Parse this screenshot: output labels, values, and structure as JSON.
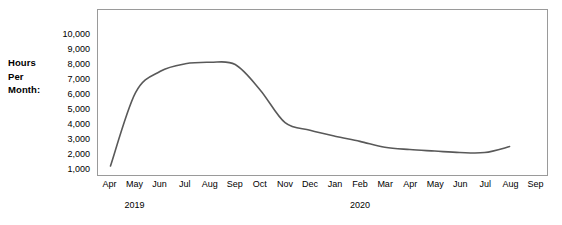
{
  "chart_data": {
    "type": "line",
    "title": "",
    "xlabel": "",
    "ylabel": "Hours Per Month:",
    "ylim": [
      0,
      10500
    ],
    "grid": false,
    "legend": "none",
    "line_color": "#595959",
    "border_color": "#9a9a9a",
    "y_ticks": [
      "10,000",
      "9,000",
      "8,000",
      "7,000",
      "6,000",
      "5,000",
      "4,000",
      "3,000",
      "2,000",
      "1,000"
    ],
    "y_tick_values": [
      10000,
      9000,
      8000,
      7000,
      6000,
      5000,
      4000,
      3000,
      2000,
      1000
    ],
    "categories": [
      "Apr",
      "May",
      "Jun",
      "Jul",
      "Aug",
      "Sep",
      "Oct",
      "Nov",
      "Dec",
      "Jan",
      "Feb",
      "Mar",
      "Apr",
      "May",
      "Jun",
      "Jul",
      "Aug",
      "Sep"
    ],
    "x_groups": [
      {
        "label": "2019",
        "start_index": 0,
        "end_index": 8,
        "center_index": 1
      },
      {
        "label": "2020",
        "start_index": 9,
        "end_index": 17,
        "center_index": 10
      }
    ],
    "series": [
      {
        "name": "Hours Per Month",
        "values": [
          1200,
          6100,
          7550,
          8050,
          8150,
          8000,
          6300,
          4100,
          3600,
          3200,
          2850,
          2450,
          2300,
          2200,
          2100,
          2100,
          2500,
          null
        ]
      }
    ]
  },
  "axis": {
    "y_title_lines": [
      "Hours",
      "Per",
      "Month:"
    ]
  }
}
